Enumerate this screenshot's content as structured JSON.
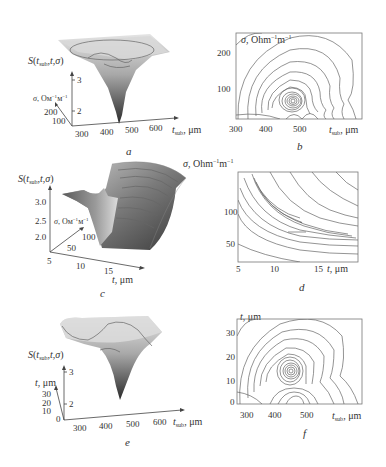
{
  "figure": {
    "panels": [
      {
        "id": "a",
        "caption": "a",
        "type": "surface3d",
        "zlabel": "S(t_sub,t,σ)",
        "z_ticks": [
          "3",
          "2"
        ],
        "ylabel": "σ, Ом⁻¹м⁻¹",
        "y_ticks": [
          "200",
          "100"
        ],
        "xlabel": "t_sub, μm",
        "x_ticks": [
          "300",
          "400",
          "500",
          "600"
        ]
      },
      {
        "id": "b",
        "caption": "b",
        "type": "contour",
        "ylabel": "σ, Ohm⁻¹m⁻¹",
        "y_ticks": [
          "200",
          "100"
        ],
        "xlabel": "t_sub, μm",
        "x_ticks": [
          "300",
          "400",
          "500"
        ]
      },
      {
        "id": "c",
        "caption": "c",
        "type": "surface3d",
        "zlabel": "S(t_sub,t,σ)",
        "z_ticks": [
          "3.0",
          "2.5",
          "2.0"
        ],
        "ylabel": "σ, Ом⁻¹м⁻¹",
        "y_ticks": [
          "100",
          "50"
        ],
        "xlabel": "t, μm",
        "x_ticks": [
          "5",
          "10",
          "15"
        ]
      },
      {
        "id": "d",
        "caption": "d",
        "type": "contour",
        "ylabel": "σ, Ohm⁻¹m⁻¹",
        "y_ticks": [
          "100",
          "50"
        ],
        "xlabel": "t, μm",
        "x_ticks": [
          "5",
          "10",
          "15"
        ]
      },
      {
        "id": "e",
        "caption": "e",
        "type": "surface3d",
        "zlabel": "S(t_sub,t,σ)",
        "z_ticks": [
          "3",
          "2"
        ],
        "ylabel": "t, μm",
        "y_ticks": [
          "30",
          "20",
          "10",
          "0"
        ],
        "xlabel": "t_sub, μm",
        "x_ticks": [
          "300",
          "400",
          "500",
          "600"
        ]
      },
      {
        "id": "f",
        "caption": "f",
        "type": "contour",
        "ylabel": "t, μm",
        "y_ticks": [
          "30",
          "20",
          "10",
          "0"
        ],
        "xlabel": "t_sub, μm",
        "x_ticks": [
          "300",
          "400",
          "500"
        ]
      }
    ]
  },
  "text": {
    "S": "S(",
    "S_sub": "sub",
    "S_rest": ",t,σ)",
    "sigma_ru": "σ, Ом",
    "sigma_ru_exp": "−1",
    "sigma_ru_m": "м",
    "sigma_en": "σ, Ohm",
    "sigma_en_exp": "−1",
    "sigma_en_m": "m",
    "t_sub": "t",
    "sub": "sub",
    "um": ", μm",
    "t_um": "t, μm"
  }
}
